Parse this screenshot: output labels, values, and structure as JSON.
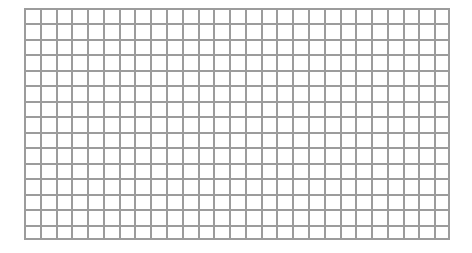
{
  "page": {
    "width": 472,
    "height": 253,
    "background_color": "#ffffff"
  },
  "grid_sheet": {
    "name": "blank-graph-paper-grid",
    "description": "Empty rectangular grid of uniform square cells, no labels or data",
    "origin_x": 24,
    "origin_y": 8,
    "width": 426,
    "height": 232,
    "columns": 27,
    "rows": 15,
    "cell_width": 15.78,
    "cell_height": 15.47,
    "line_color": "#9c9c9c",
    "line_width": 2,
    "cell_fill_color": "#ffffff",
    "frame_color": "#9c9c9c",
    "frame_width": 2
  },
  "chart_data": {
    "type": "table",
    "title": "",
    "subtitle": "",
    "xlabel": "",
    "ylabel": "",
    "grid": true,
    "legend": false,
    "legend_position": "none",
    "columns": 27,
    "rows": 15,
    "cells": [],
    "tick_labels_x": [],
    "tick_labels_y": [],
    "annotations": [],
    "series": []
  }
}
